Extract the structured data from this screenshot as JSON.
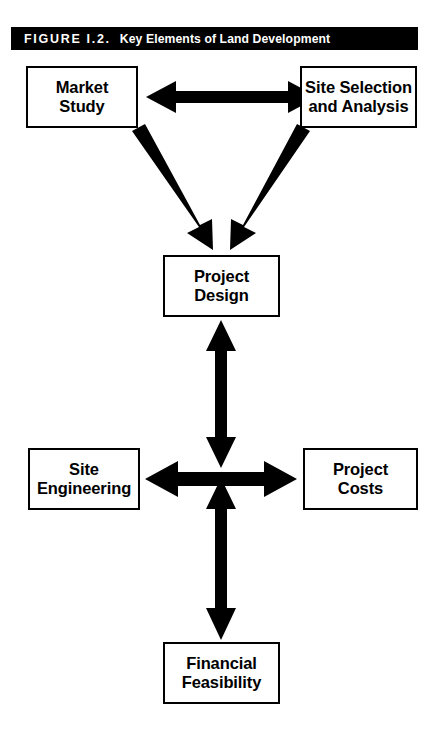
{
  "figure": {
    "number_label": "FIGURE I.2.",
    "caption": "Key Elements of Land Development",
    "banner_bg": "#000000",
    "banner_text_color": "#ffffff",
    "ink_color": "#000000",
    "page_bg": "#ffffff"
  },
  "nodes": [
    {
      "id": "market-study",
      "line1": "Market",
      "line2": "Study"
    },
    {
      "id": "site-selection",
      "line1": "Site Selection",
      "line2": "and Analysis"
    },
    {
      "id": "project-design",
      "line1": "Project",
      "line2": "Design"
    },
    {
      "id": "site-engineering",
      "line1": "Site",
      "line2": "Engineering"
    },
    {
      "id": "project-costs",
      "line1": "Project",
      "line2": "Costs"
    },
    {
      "id": "financial-feasibility",
      "line1": "Financial",
      "line2": "Feasibility"
    }
  ],
  "connectors": [
    {
      "id": "market-study--site-selection",
      "style": "double-headed",
      "orientation": "horizontal"
    },
    {
      "id": "market-study--project-design",
      "style": "single-headed",
      "orientation": "diagonal-down-right"
    },
    {
      "id": "site-selection--project-design",
      "style": "single-headed",
      "orientation": "diagonal-down-left"
    },
    {
      "id": "project-design--center",
      "style": "double-headed",
      "orientation": "vertical"
    },
    {
      "id": "site-engineering--project-costs",
      "style": "double-headed",
      "orientation": "horizontal"
    },
    {
      "id": "center--financial-feasibility",
      "style": "double-headed",
      "orientation": "vertical"
    }
  ]
}
